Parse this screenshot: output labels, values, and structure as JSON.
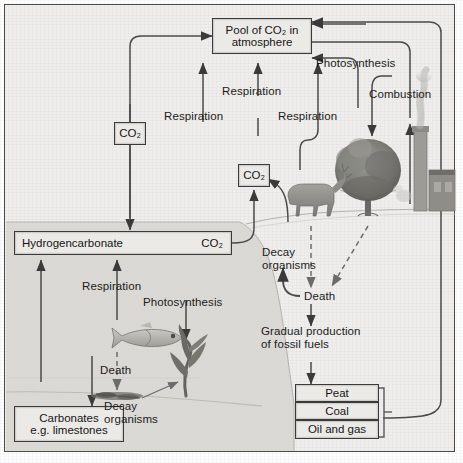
{
  "diagram": {
    "frame_color": "#4a4a4a",
    "background_color": "#efeeec",
    "sea_color": "#d8d6d2"
  },
  "boxes": {
    "atmosphere_pool": "Pool of CO₂ in atmosphere",
    "co2_left": "CO₂",
    "co2_mid": "CO₂",
    "hydrogencarbonate_left": "Hydrogencarbonate",
    "hydrogencarbonate_right": "CO₂",
    "carbonates": "Carbonates\ne.g. limestones",
    "fuel_peat": "Peat",
    "fuel_coal": "Coal",
    "fuel_oil_gas": "Oil and gas"
  },
  "labels": {
    "respiration_left": "Respiration",
    "respiration_mid": "Respiration",
    "respiration_right": "Respiration",
    "photosynthesis_land": "Photosynthesis",
    "combustion": "Combustion",
    "decay_organisms_land": "Decay\norganisms",
    "death_land": "Death",
    "gradual_production": "Gradual production\nof fossil fuels",
    "respiration_sea": "Respiration",
    "photosynthesis_sea": "Photosynthesis",
    "death_sea": "Death",
    "decay_organisms_sea": "Decay\norganisms"
  },
  "figures": {
    "tree": "tree-illustration",
    "factory": "factory-chimney-illustration",
    "deer": "deer-illustration",
    "fish": "fish-illustration",
    "seaweed": "seaweed-illustration",
    "sediment": "sediment-illustration"
  }
}
